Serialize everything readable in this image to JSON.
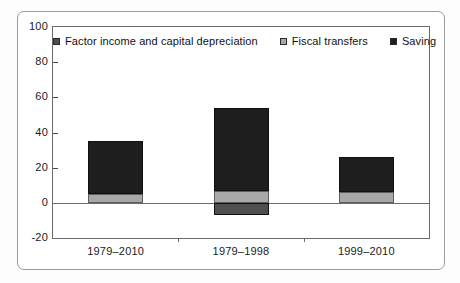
{
  "chart_data": {
    "type": "bar",
    "subtype": "stacked-bar",
    "title": "",
    "xlabel": "",
    "ylabel": "",
    "ylim": [
      -20,
      100
    ],
    "ytick_labels": [
      "100",
      "80",
      "60",
      "40",
      "20",
      "0",
      "-20"
    ],
    "ytick_values": [
      100,
      80,
      60,
      40,
      20,
      0,
      -20
    ],
    "ygrid": false,
    "legend_position": "top-left-inside",
    "categories": [
      "1979–2010",
      "1979–1998",
      "1999–2010"
    ],
    "series": [
      {
        "name": "Factor income and capital depreciation",
        "color": "#4f4f4f",
        "values": [
          0,
          -7,
          0
        ]
      },
      {
        "name": "Fiscal transfers",
        "color": "#a8a8a8",
        "values": [
          5,
          7,
          6
        ]
      },
      {
        "name": "Saving",
        "color": "#1e1e1e",
        "values": [
          30,
          47,
          20
        ]
      }
    ],
    "bar_totals": [
      35,
      50,
      26
    ]
  },
  "legend": {
    "items": [
      {
        "label": "Factor income and capital depreciation",
        "swatch": "#4f4f4f"
      },
      {
        "label": "Fiscal transfers",
        "swatch": "#a8a8a8"
      },
      {
        "label": "Saving",
        "swatch": "#1e1e1e"
      }
    ]
  },
  "axis": {
    "y_labels": [
      "100",
      "80",
      "60",
      "40",
      "20",
      "0",
      "-20"
    ],
    "x_labels": [
      "1979–2010",
      "1979–1998",
      "1999–2010"
    ]
  }
}
